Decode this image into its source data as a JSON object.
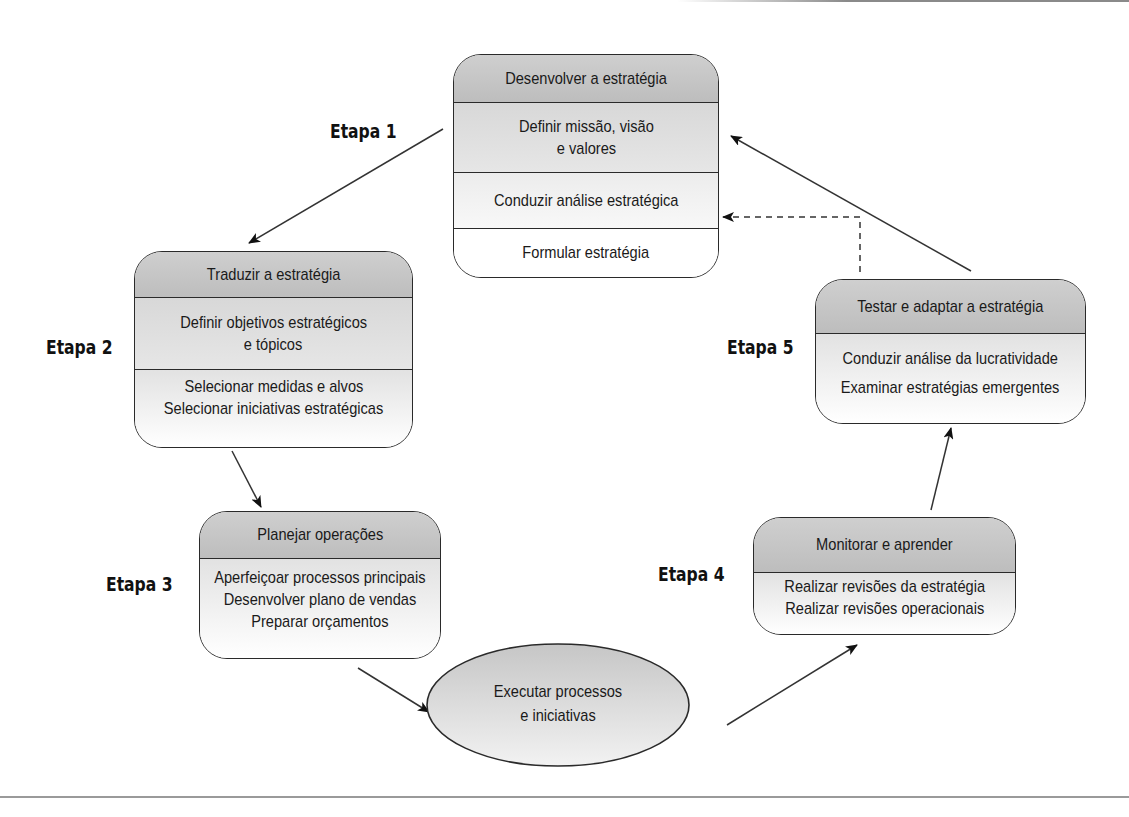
{
  "diagram": {
    "type": "cycle",
    "stages": [
      {
        "step_label": "Etapa 1",
        "title": "Desenvolver a estratégia",
        "items": [
          [
            "Definir missão, visão",
            "e valores"
          ],
          [
            "Conduzir análise estratégica"
          ],
          [
            "Formular estratégia"
          ]
        ]
      },
      {
        "step_label": "Etapa 2",
        "title": "Traduzir a estratégia",
        "items": [
          [
            "Definir objetivos estratégicos",
            "e tópicos"
          ],
          [
            "Selecionar medidas e alvos",
            "Selecionar iniciativas estratégicas"
          ]
        ]
      },
      {
        "step_label": "Etapa 3",
        "title": "Planejar operações",
        "items": [
          [
            "Aperfeiçoar processos principais",
            "Desenvolver plano de vendas",
            "Preparar orçamentos"
          ]
        ]
      },
      {
        "step_label": "Etapa 4",
        "title": "Monitorar e aprender",
        "items": [
          [
            "Realizar revisões da estratégia",
            "Realizar revisões operacionais"
          ]
        ]
      },
      {
        "step_label": "Etapa 5",
        "title": "Testar e adaptar a estratégia",
        "items": [
          [
            "Conduzir análise da lucratividade",
            "Examinar estratégias emergentes"
          ]
        ]
      }
    ],
    "execution": {
      "lines": [
        "Executar processos",
        "e iniciativas"
      ]
    },
    "connections": [
      {
        "from": "Etapa 1",
        "to": "Etapa 2",
        "style": "solid"
      },
      {
        "from": "Etapa 2",
        "to": "Etapa 3",
        "style": "solid"
      },
      {
        "from": "Etapa 3",
        "to": "Executar processos e iniciativas",
        "style": "solid"
      },
      {
        "from": "Executar processos e iniciativas",
        "to": "Etapa 4",
        "style": "solid"
      },
      {
        "from": "Etapa 4",
        "to": "Etapa 5",
        "style": "solid"
      },
      {
        "from": "Etapa 5",
        "to": "Etapa 1 / Definir missão, visão e valores",
        "style": "solid"
      },
      {
        "from": "Etapa 5",
        "to": "Etapa 1 / Conduzir análise estratégica",
        "style": "dashed"
      }
    ]
  }
}
